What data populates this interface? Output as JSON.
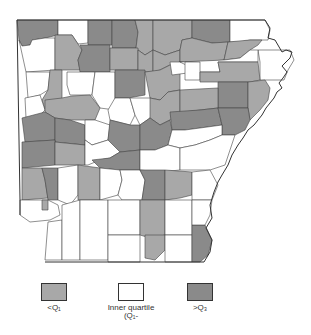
{
  "map": {
    "region": "Arkansas counties",
    "colors": {
      "low": "#a8a8a8",
      "inner": "#ffffff",
      "high": "#8a8a8a",
      "border": "#444444"
    }
  },
  "legend": {
    "items": [
      {
        "key": "low",
        "label": "<Q₁",
        "color": "#a8a8a8"
      },
      {
        "key": "inner",
        "label": "Inner quartile (Q₁-",
        "color": "#ffffff"
      },
      {
        "key": "high",
        "label": ">Q₃",
        "color": "#8a8a8a"
      }
    ]
  }
}
